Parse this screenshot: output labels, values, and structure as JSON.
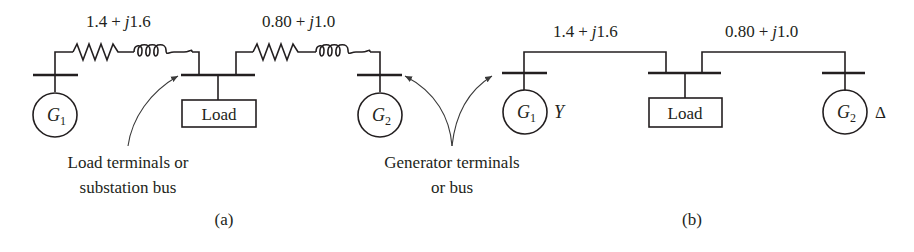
{
  "figure": {
    "panel_a": {
      "label": "(a)",
      "impedance_1": {
        "real": "1.4",
        "plus": "+",
        "j": "j",
        "imag": "1.6"
      },
      "impedance_2": {
        "real": "0.80",
        "plus": "+",
        "j": "j",
        "imag": "1.0"
      },
      "generator_1": {
        "symbol": "G",
        "subscript": "1"
      },
      "generator_2": {
        "symbol": "G",
        "subscript": "2"
      },
      "load_label": "Load",
      "annotation_load": {
        "line1": "Load terminals or",
        "line2": "substation bus"
      }
    },
    "shared": {
      "annotation_generator": {
        "line1": "Generator terminals",
        "line2": "or bus"
      }
    },
    "panel_b": {
      "label": "(b)",
      "impedance_1": {
        "real": "1.4",
        "plus": "+",
        "j": "j",
        "imag": "1.6"
      },
      "impedance_2": {
        "real": "0.80",
        "plus": "+",
        "j": "j",
        "imag": "1.0"
      },
      "generator_1": {
        "symbol": "G",
        "subscript": "1",
        "connection": "Y"
      },
      "generator_2": {
        "symbol": "G",
        "subscript": "2",
        "connection": "Δ"
      },
      "load_label": "Load"
    },
    "colors": {
      "line": "#231f20",
      "background": "#ffffff"
    }
  }
}
